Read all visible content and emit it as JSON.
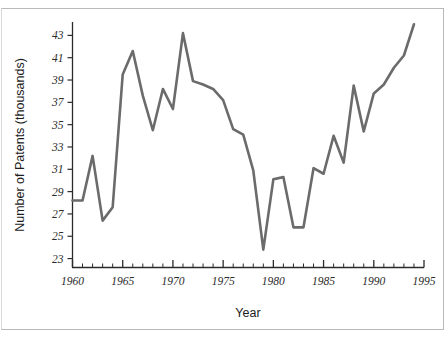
{
  "chart_data": {
    "type": "line",
    "title": "",
    "subtitle": "",
    "xlabel": "Year",
    "ylabel": "Number of Patents (thousands)",
    "xlim": [
      1960,
      1995
    ],
    "ylim": [
      22.2,
      44.2
    ],
    "x_major_ticks": [
      1960,
      1965,
      1970,
      1975,
      1980,
      1985,
      1990,
      1995
    ],
    "x_major_tick_labels": [
      "1960",
      "1965",
      "1970",
      "1975",
      "1980",
      "1985",
      "1990",
      "1995"
    ],
    "x_minor_tick_step": 1,
    "y_ticks": [
      23,
      25,
      27,
      29,
      31,
      33,
      35,
      37,
      39,
      41,
      43
    ],
    "y_tick_labels": [
      "23",
      "25",
      "27",
      "29",
      "31",
      "33",
      "35",
      "37",
      "39",
      "41",
      "43"
    ],
    "grid": false,
    "legend": false,
    "legend_position": "none",
    "line_color": "#6b6b6b",
    "line_width_px": 2.6,
    "markers": false,
    "x": [
      1960,
      1961,
      1962,
      1963,
      1964,
      1965,
      1966,
      1967,
      1968,
      1969,
      1970,
      1971,
      1972,
      1973,
      1974,
      1975,
      1976,
      1977,
      1978,
      1979,
      1980,
      1981,
      1982,
      1983,
      1984,
      1985,
      1986,
      1987,
      1988,
      1989,
      1990,
      1991,
      1992,
      1993,
      1994
    ],
    "values": [
      28.2,
      28.2,
      32.2,
      26.4,
      27.6,
      39.5,
      41.6,
      37.6,
      34.5,
      38.2,
      36.4,
      43.2,
      38.9,
      38.6,
      38.2,
      37.2,
      34.6,
      34.1,
      30.9,
      23.8,
      30.1,
      30.3,
      25.8,
      25.8,
      31.1,
      30.6,
      34.0,
      31.6,
      38.5,
      34.4,
      37.8,
      38.6,
      40.1,
      41.2,
      44.0
    ],
    "series": [
      {
        "name": "Number of Patents",
        "values": [
          28.2,
          28.2,
          32.2,
          26.4,
          27.6,
          39.5,
          41.6,
          37.6,
          34.5,
          38.2,
          36.4,
          43.2,
          38.9,
          38.6,
          38.2,
          37.2,
          34.6,
          34.1,
          30.9,
          23.8,
          30.1,
          30.3,
          25.8,
          25.8,
          31.1,
          30.6,
          34.0,
          31.6,
          38.5,
          34.4,
          37.8,
          38.6,
          40.1,
          41.2,
          44.0
        ]
      }
    ]
  },
  "axes": {
    "x_title": "Year",
    "y_title": "Number of Patents (thousands)"
  },
  "colors": {
    "line": "#6b6b6b",
    "axis": "#2b2b2b",
    "background": "#ffffff",
    "frame": "#b9b9b9"
  }
}
